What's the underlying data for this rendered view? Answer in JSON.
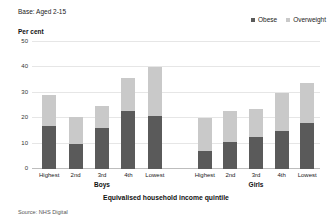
{
  "header": {
    "base_note": "Base: Aged 2-15",
    "per_cent_label": "Per cent"
  },
  "legend": {
    "position": "top-right",
    "items": [
      {
        "label": "Obese",
        "color": "#5a5a5a",
        "icon": "square-swatch-icon"
      },
      {
        "label": "Overweight",
        "color": "#c9c9c9",
        "icon": "square-swatch-icon"
      }
    ]
  },
  "panels": [
    {
      "label": "Boys"
    },
    {
      "label": "Girls"
    }
  ],
  "axis": {
    "x_title": "Equivalised household income quintile",
    "y_title": "Per cent",
    "y_ticks": [
      "0",
      "10",
      "20",
      "30",
      "40",
      "50"
    ]
  },
  "footer": {
    "source": "Source: NHS Digital"
  },
  "chart_data": {
    "type": "bar",
    "title": "",
    "subtitle": "Base: Aged 2-15",
    "stacked": true,
    "xlabel": "Equivalised household income quintile",
    "ylabel": "Per cent",
    "ylim": [
      0,
      50
    ],
    "yticks": [
      0,
      10,
      20,
      30,
      40,
      50
    ],
    "grid": true,
    "legend_position": "top-right",
    "panels": [
      "Boys",
      "Girls"
    ],
    "categories": [
      "Highest",
      "2nd",
      "3rd",
      "4th",
      "Lowest"
    ],
    "series": [
      {
        "name": "Obese",
        "color": "#5a5a5a",
        "values_boys": [
          17,
          10,
          16,
          23,
          21
        ],
        "values_girls": [
          7,
          10.5,
          12.5,
          15,
          18
        ]
      },
      {
        "name": "Overweight",
        "color": "#c9c9c9",
        "values_boys": [
          12,
          10.5,
          9,
          13,
          19
        ],
        "values_girls": [
          13,
          12.5,
          11,
          15,
          16
        ]
      }
    ],
    "totals_boys": [
      29,
      20.5,
      25,
      36,
      40
    ],
    "totals_girls": [
      20,
      23,
      23.5,
      30,
      34
    ]
  }
}
